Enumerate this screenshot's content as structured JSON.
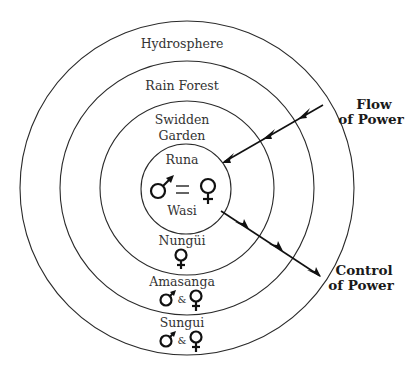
{
  "diagram": {
    "rings": [
      {
        "label": "Hydrosphere"
      },
      {
        "label": "Rain Forest"
      },
      {
        "label_lines": [
          "Swidden",
          "Garden"
        ]
      },
      {
        "label_top": "Runa",
        "label_bottom": "Wasi",
        "relation": "=",
        "symbols": [
          "male",
          "female"
        ]
      }
    ],
    "lower_entities": [
      {
        "label": "Nungüi",
        "symbols": [
          "female"
        ]
      },
      {
        "label": "Amasanga",
        "symbols": [
          "male",
          "female"
        ],
        "joiner": "&"
      },
      {
        "label": "Sungui",
        "symbols": [
          "male",
          "female"
        ],
        "joiner": "&"
      }
    ],
    "arrows": [
      {
        "label_lines": [
          "Flow",
          "of Power"
        ],
        "direction": "inward"
      },
      {
        "label_lines": [
          "Control",
          "of Power"
        ],
        "direction": "outward"
      }
    ],
    "colors": {
      "stroke": "#2a2a2a",
      "text": "#333333",
      "background": "#ffffff"
    }
  }
}
